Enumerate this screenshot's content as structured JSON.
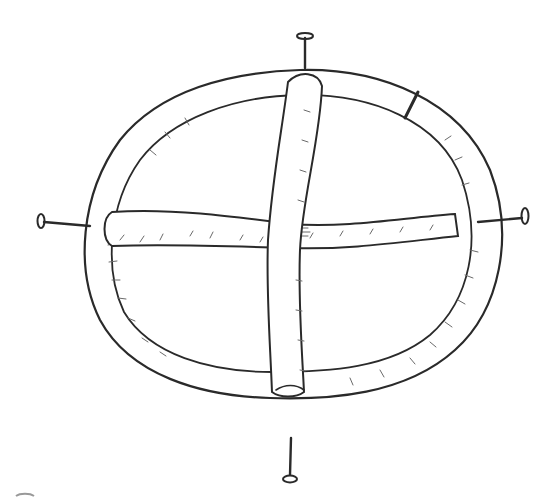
{
  "image": {
    "subject": "pencil sketch of a ring with a cross of tubes, pinned by four nails",
    "style": "graphite line drawing on white paper",
    "colors": {
      "background": "#ffffff",
      "line": "#2a2a2a",
      "shading": "#6a6a6a"
    },
    "elements": {
      "ring": "outer circular tube",
      "vertical_bar": "tube crossing top to bottom",
      "horizontal_bar": "tube crossing left to right",
      "nails": [
        "top",
        "left",
        "right",
        "bottom"
      ],
      "ring_seam": "joint mark at upper right of ring"
    }
  }
}
